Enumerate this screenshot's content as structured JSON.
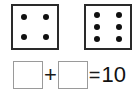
{
  "worksheet": {
    "type": "dice-addition-problem",
    "dice": [
      {
        "name": "first-die",
        "pip_count": 4,
        "value": "4",
        "pip_layout": "2x2"
      },
      {
        "name": "second-die",
        "pip_count": 6,
        "value": "6",
        "pip_layout": "2x3"
      }
    ],
    "equation": {
      "first_blank_value": "",
      "plus_operator": "+",
      "second_blank_value": "",
      "equals_operator": "=",
      "sum": "10"
    }
  },
  "colors": {
    "background": "#ffffff",
    "die_border": "#2a2a2a",
    "pip": "#101010",
    "answer_box_border": "#9a9a9a",
    "text": "#111111"
  }
}
